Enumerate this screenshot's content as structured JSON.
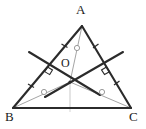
{
  "figure": {
    "background_color": "#ffffff",
    "stroke_color": "#2b2b2b",
    "light_stroke_color": "#8a8a8a",
    "vertices": [
      {
        "name": "A",
        "label": "A",
        "x": 82,
        "y": 26,
        "label_x": 76,
        "label_y": 3
      },
      {
        "name": "B",
        "label": "B",
        "x": 13,
        "y": 108,
        "label_x": 5,
        "label_y": 110
      },
      {
        "name": "C",
        "label": "C",
        "x": 131,
        "y": 108,
        "label_x": 130,
        "label_y": 110
      }
    ],
    "center_point": {
      "name": "O",
      "label": "O",
      "x": 70,
      "y": 82,
      "label_x": 62,
      "label_y": 58
    },
    "sides": [
      {
        "name": "side-AB",
        "from": "A",
        "to": "B",
        "tick_marks": 2
      },
      {
        "name": "side-AC",
        "from": "A",
        "to": "C",
        "tick_marks": 2
      },
      {
        "name": "side-BC",
        "from": "B",
        "to": "C",
        "tick_marks": 0
      }
    ],
    "midpoints": [
      {
        "name": "midpoint-AB",
        "x": 47.5,
        "y": 67
      },
      {
        "name": "midpoint-AC",
        "x": 106.5,
        "y": 67
      }
    ],
    "perpendicular_bisectors": [
      {
        "name": "perp-bisector-AB",
        "x1": 29,
        "y1": 52,
        "x2": 100,
        "y2": 95,
        "right_angle_at": "midpoint-AB"
      },
      {
        "name": "perp-bisector-AC",
        "x1": 123,
        "y1": 52,
        "x2": 45,
        "y2": 97,
        "right_angle_at": "midpoint-AC"
      }
    ],
    "cevians": [
      {
        "name": "cevian-A-to-O",
        "from": "A",
        "to": "O",
        "marker_x": 77,
        "marker_y": 48
      },
      {
        "name": "cevian-B-to-O",
        "from": "B",
        "to": "O",
        "marker_x": 44,
        "marker_y": 92
      },
      {
        "name": "cevian-C-to-O",
        "from": "C",
        "to": "O",
        "marker_x": 102,
        "marker_y": 92
      }
    ],
    "altitude_segment": {
      "name": "altitude-O-to-BC",
      "x1": 70,
      "y1": 82,
      "x2": 70,
      "y2": 108
    },
    "right_angle_marks": [
      {
        "name": "right-angle-mark-AB",
        "x": 47.5,
        "y": 67
      },
      {
        "name": "right-angle-mark-AC",
        "x": 106.5,
        "y": 67
      }
    ],
    "circle_markers": [
      {
        "name": "marker-on-cevian-A",
        "x": 77,
        "y": 48
      },
      {
        "name": "marker-on-cevian-B",
        "x": 44,
        "y": 92
      },
      {
        "name": "marker-on-cevian-C",
        "x": 102,
        "y": 92
      }
    ]
  }
}
